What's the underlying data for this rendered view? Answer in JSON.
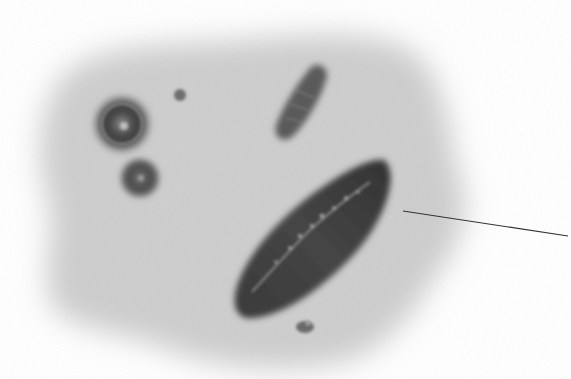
{
  "figure": {
    "kind": "micrograph illustration",
    "background_color": "#ffffff",
    "field_color": "#cfcfcf",
    "objects": [
      {
        "name": "large-elongated-particle",
        "shade": "#3a3a3a"
      },
      {
        "name": "ringed-round-particle",
        "shade": "#4a4a4a"
      },
      {
        "name": "small-round-particle",
        "shade": "#4d4d4d"
      },
      {
        "name": "tiny-dot",
        "shade": "#707070"
      },
      {
        "name": "rod-particle",
        "shade": "#5a5a5a"
      },
      {
        "name": "small-bottom-particle",
        "shade": "#6a6a6a"
      }
    ],
    "leader_line": {
      "x1": 403,
      "y1": 211,
      "x2": 568,
      "y2": 236,
      "color": "#333333"
    }
  }
}
